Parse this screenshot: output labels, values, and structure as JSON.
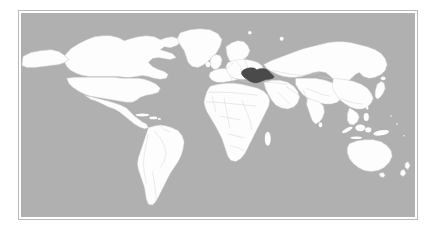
{
  "figure": {
    "type": "world-locator-map",
    "projection": "equirectangular",
    "title": "",
    "caption": ""
  },
  "colors": {
    "page_background": "#ffffff",
    "frame_border": "#b9b9b9",
    "ocean": "#b0b0b0",
    "land_fill": "#fdfdfd",
    "land_border": "#cfcfcf",
    "highlight_fill": "#4a4a4a",
    "highlight_border": "#3a3a3a"
  },
  "frame": {
    "x": 18,
    "y": 10,
    "width": 400,
    "height": 210,
    "border_width": 1,
    "inner_padding": 2
  },
  "map": {
    "background_label": "ocean",
    "land_label": "landmasses",
    "graticule_visible": false,
    "labels_visible": false,
    "legend_visible": false,
    "scale_bar_visible": false,
    "highlighted_regions": [
      {
        "name": "Ukraine",
        "code": "UA",
        "fill": "#4a4a4a",
        "pixel_bbox": [
          226,
          73,
          248,
          86
        ]
      }
    ],
    "continents_shown": [
      "North America",
      "South America",
      "Europe",
      "Africa",
      "Asia",
      "Oceania"
    ]
  },
  "chart_data": {
    "type": "map",
    "title": "",
    "xlabel": "",
    "ylabel": "",
    "projection": "equirectangular",
    "lon_range": [
      -180,
      180
    ],
    "lat_range": [
      -60,
      84
    ],
    "value_field": "highlighted",
    "categories": [
      "Ukraine",
      "Other countries",
      "Ocean"
    ],
    "values": [
      1,
      0,
      0
    ],
    "color_map": {
      "Ukraine": "#4a4a4a",
      "Other countries": "#fdfdfd",
      "Ocean": "#b0b0b0"
    },
    "legend_position": "none",
    "grid": false,
    "annotations": []
  }
}
